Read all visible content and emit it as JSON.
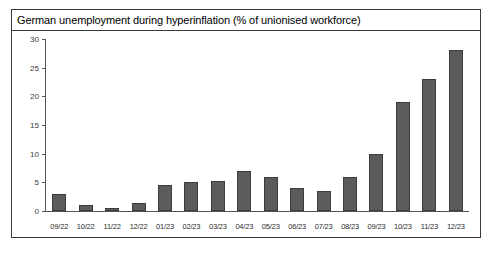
{
  "chart_data": {
    "type": "bar",
    "title": "German unemployment during hyperinflation (% of unionised workforce)",
    "xlabel": "",
    "ylabel": "",
    "ylim": [
      0,
      30
    ],
    "yticks": [
      0,
      5,
      10,
      15,
      20,
      25,
      30
    ],
    "grid": false,
    "legend": null,
    "bar_color": "#5c5c5c",
    "bar_edge_color": "#3d3d3d",
    "categories": [
      "09/22",
      "10/22",
      "11/22",
      "12/22",
      "01/23",
      "02/23",
      "03/23",
      "04/23",
      "05/23",
      "06/23",
      "07/23",
      "08/23",
      "09/23",
      "10/23",
      "11/23",
      "12/23"
    ],
    "values": [
      3.0,
      1.0,
      0.6,
      1.4,
      4.5,
      5.0,
      5.2,
      7.0,
      6.0,
      4.0,
      3.5,
      6.0,
      10.0,
      19.0,
      23.0,
      28.0
    ]
  }
}
